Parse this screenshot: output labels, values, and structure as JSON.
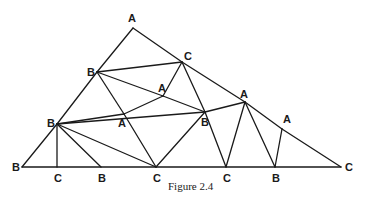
{
  "figure": {
    "caption": "Figure 2.4",
    "vertices": [
      {
        "id": "top",
        "label": "A",
        "x": 133,
        "y": 28,
        "lx": 128,
        "ly": 22
      },
      {
        "id": "b_ul",
        "label": "B",
        "x": 97,
        "y": 72,
        "lx": 87,
        "ly": 76
      },
      {
        "id": "c_up",
        "label": "C",
        "x": 182,
        "y": 62,
        "lx": 184,
        "ly": 60
      },
      {
        "id": "a_mid",
        "label": "A",
        "x": 163,
        "y": 96,
        "lx": 158,
        "ly": 92
      },
      {
        "id": "a_low",
        "label": "A",
        "x": 124,
        "y": 114,
        "lx": 118,
        "ly": 127
      },
      {
        "id": "b_mid",
        "label": "B",
        "x": 205,
        "y": 112,
        "lx": 201,
        "ly": 126
      },
      {
        "id": "a_right",
        "label": "A",
        "x": 245,
        "y": 102,
        "lx": 240,
        "ly": 98
      },
      {
        "id": "a_far",
        "label": "A",
        "x": 282,
        "y": 129,
        "lx": 283,
        "ly": 123
      },
      {
        "id": "b_left",
        "label": "B",
        "x": 57,
        "y": 124,
        "lx": 47,
        "ly": 127
      },
      {
        "id": "b_bl",
        "label": "B",
        "x": 22,
        "y": 167,
        "lx": 12,
        "ly": 171
      },
      {
        "id": "c_b1",
        "label": "C",
        "x": 57,
        "y": 167,
        "lx": 54,
        "ly": 182
      },
      {
        "id": "b_b1",
        "label": "B",
        "x": 101,
        "y": 167,
        "lx": 98,
        "ly": 182
      },
      {
        "id": "c_b2",
        "label": "C",
        "x": 156,
        "y": 167,
        "lx": 153,
        "ly": 182
      },
      {
        "id": "c_b3",
        "label": "C",
        "x": 226,
        "y": 167,
        "lx": 223,
        "ly": 182
      },
      {
        "id": "b_b2",
        "label": "B",
        "x": 275,
        "y": 167,
        "lx": 272,
        "ly": 182
      },
      {
        "id": "c_far",
        "label": "C",
        "x": 341,
        "y": 167,
        "lx": 345,
        "ly": 171
      }
    ],
    "edges": [
      [
        "top",
        "b_ul"
      ],
      [
        "top",
        "c_up"
      ],
      [
        "b_ul",
        "b_left"
      ],
      [
        "b_left",
        "b_bl"
      ],
      [
        "c_up",
        "a_right"
      ],
      [
        "a_right",
        "a_far"
      ],
      [
        "a_far",
        "c_far"
      ],
      [
        "b_bl",
        "c_far"
      ],
      [
        "b_ul",
        "c_up"
      ],
      [
        "b_ul",
        "a_mid"
      ],
      [
        "b_ul",
        "a_low"
      ],
      [
        "c_up",
        "a_mid"
      ],
      [
        "c_up",
        "b_mid"
      ],
      [
        "a_mid",
        "a_low"
      ],
      [
        "a_mid",
        "b_mid"
      ],
      [
        "b_left",
        "a_low"
      ],
      [
        "b_left",
        "b_mid"
      ],
      [
        "b_left",
        "c_b1"
      ],
      [
        "b_left",
        "b_b1"
      ],
      [
        "b_left",
        "c_b2"
      ],
      [
        "a_low",
        "c_b2"
      ],
      [
        "b_mid",
        "c_b2"
      ],
      [
        "b_mid",
        "a_right"
      ],
      [
        "b_mid",
        "c_b3"
      ],
      [
        "a_right",
        "c_b3"
      ],
      [
        "a_right",
        "b_b2"
      ],
      [
        "a_far",
        "b_b2"
      ]
    ]
  }
}
